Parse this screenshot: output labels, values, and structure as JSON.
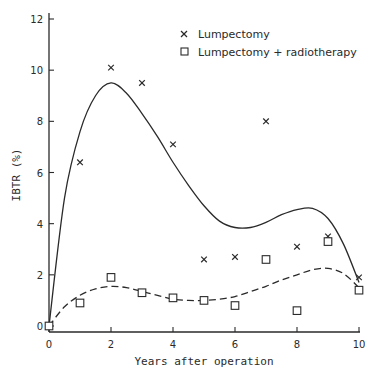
{
  "chart_data": {
    "type": "scatter",
    "title": "",
    "xlabel": "Years after operation",
    "ylabel": "IBTR (%)",
    "xlim": [
      0,
      10
    ],
    "ylim": [
      0,
      12
    ],
    "x_ticks": [
      0,
      2,
      4,
      6,
      8,
      10
    ],
    "y_ticks": [
      0,
      2,
      4,
      6,
      8,
      10,
      12
    ],
    "grid": false,
    "legend_position": "top-right",
    "series": [
      {
        "name": "Lumpectomy",
        "marker": "x",
        "x": [
          1,
          2,
          3,
          4,
          5,
          6,
          7,
          8,
          9,
          10
        ],
        "values": [
          6.4,
          10.1,
          9.5,
          7.1,
          2.6,
          2.7,
          8.0,
          3.1,
          3.5,
          1.9
        ],
        "fit_line": "solid",
        "fit_curve": [
          [
            0,
            0
          ],
          [
            0.5,
            5.0
          ],
          [
            1,
            7.6
          ],
          [
            1.5,
            9.0
          ],
          [
            2,
            9.5
          ],
          [
            2.5,
            9.1
          ],
          [
            3,
            8.3
          ],
          [
            3.5,
            7.4
          ],
          [
            4,
            6.4
          ],
          [
            4.5,
            5.5
          ],
          [
            5,
            4.7
          ],
          [
            5.5,
            4.1
          ],
          [
            6,
            3.85
          ],
          [
            6.5,
            3.85
          ],
          [
            7,
            4.05
          ],
          [
            7.5,
            4.35
          ],
          [
            8,
            4.55
          ],
          [
            8.5,
            4.6
          ],
          [
            9,
            4.2
          ],
          [
            9.5,
            3.2
          ],
          [
            10,
            1.7
          ]
        ]
      },
      {
        "name": "Lumpectomy + radiotherapy",
        "marker": "square",
        "x": [
          0,
          1,
          2,
          3,
          4,
          5,
          6,
          7,
          8,
          9,
          10
        ],
        "values": [
          0,
          0.9,
          1.9,
          1.3,
          1.1,
          1.0,
          0.8,
          2.6,
          0.6,
          3.3,
          1.4
        ],
        "fit_line": "dashed",
        "fit_curve": [
          [
            0,
            0
          ],
          [
            0.5,
            0.75
          ],
          [
            1,
            1.2
          ],
          [
            1.5,
            1.45
          ],
          [
            2,
            1.55
          ],
          [
            2.5,
            1.5
          ],
          [
            3,
            1.35
          ],
          [
            3.5,
            1.2
          ],
          [
            4,
            1.05
          ],
          [
            4.5,
            1.0
          ],
          [
            5,
            1.0
          ],
          [
            5.5,
            1.05
          ],
          [
            6,
            1.15
          ],
          [
            6.5,
            1.35
          ],
          [
            7,
            1.55
          ],
          [
            7.5,
            1.8
          ],
          [
            8,
            2.0
          ],
          [
            8.5,
            2.2
          ],
          [
            9,
            2.25
          ],
          [
            9.5,
            2.05
          ],
          [
            10,
            1.5
          ]
        ]
      }
    ]
  },
  "legend": {
    "items": [
      {
        "label": "Lumpectomy",
        "marker": "x"
      },
      {
        "label": "Lumpectomy + radiotherapy",
        "marker": "square"
      }
    ]
  },
  "axes": {
    "x_label": "Years after operation",
    "y_label": "IBTR (%)",
    "x_tick_labels": [
      "0",
      "2",
      "4",
      "6",
      "8",
      "10"
    ],
    "y_tick_labels": [
      "0",
      "2",
      "4",
      "6",
      "8",
      "10",
      "12"
    ]
  },
  "colors": {
    "ink": "#2a2a2a",
    "background": "#ffffff"
  }
}
